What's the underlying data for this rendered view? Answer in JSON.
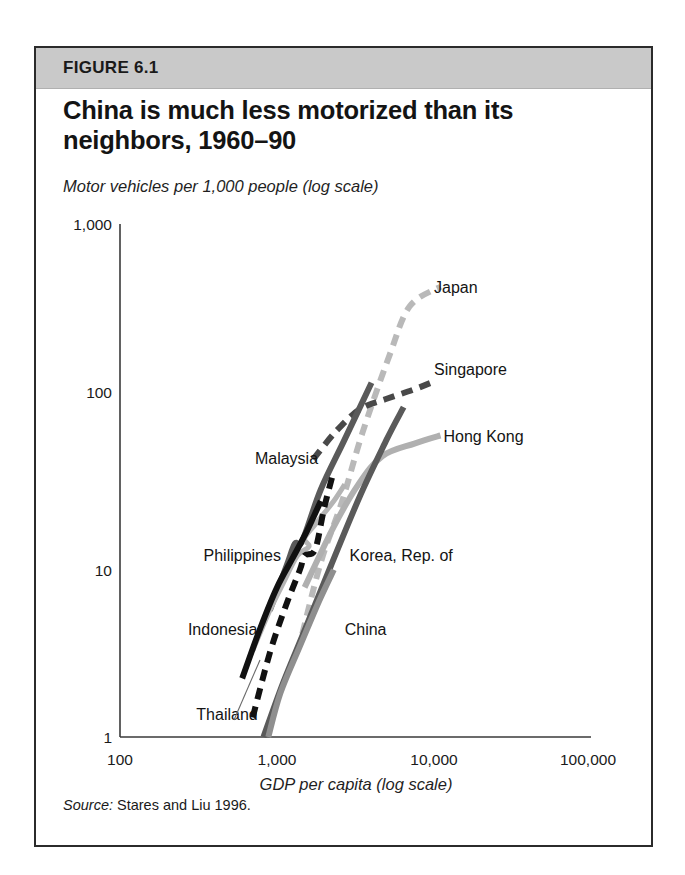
{
  "figure": {
    "number_label": "FIGURE 6.1",
    "title": "China is much less motorized than its neighbors, 1960–90",
    "source_prefix": "Source:",
    "source_text": " Stares and Liu 1996."
  },
  "chart_data": {
    "type": "line",
    "title": "China is much less motorized than its neighbors, 1960–90",
    "subtitle": "Motor vehicles per 1,000 people (log scale)",
    "xlabel": "GDP per capita (log scale)",
    "ylabel": "Motor vehicles per 1,000 people (log scale)",
    "xscale": "log",
    "yscale": "log",
    "xlim": [
      100,
      100000
    ],
    "ylim": [
      1,
      1000
    ],
    "xticks": [
      100,
      1000,
      10000,
      100000
    ],
    "xtick_labels": [
      "100",
      "1,000",
      "10,000",
      "100,000"
    ],
    "yticks": [
      1,
      10,
      100,
      1000
    ],
    "ytick_labels": [
      "1",
      "10",
      "100",
      "1,000"
    ],
    "grid": false,
    "legend": "inline-labels",
    "period": "1960–90",
    "series": [
      {
        "name": "Japan",
        "style": "dashed",
        "color": "#b9b9b9",
        "width": 6,
        "label_x": 10000,
        "label_y": 420,
        "points": [
          [
            1450,
            4.0
          ],
          [
            1900,
            10.5
          ],
          [
            2600,
            24.0
          ],
          [
            3500,
            60.0
          ],
          [
            5200,
            170.0
          ],
          [
            7000,
            330.0
          ],
          [
            11000,
            430.0
          ]
        ]
      },
      {
        "name": "Singapore",
        "style": "dashed",
        "color": "#494949",
        "width": 6,
        "label_x": 10000,
        "label_y": 140,
        "points": [
          [
            1700,
            42.0
          ],
          [
            2400,
            62.0
          ],
          [
            3400,
            83.0
          ],
          [
            5000,
            95.0
          ],
          [
            7500,
            108.0
          ],
          [
            10000,
            120.0
          ]
        ]
      },
      {
        "name": "Hong Kong",
        "style": "solid",
        "color": "#b0b0b0",
        "width": 6,
        "label_x": 11500,
        "label_y": 57,
        "points": [
          [
            1500,
            7.5
          ],
          [
            2300,
            17.0
          ],
          [
            3300,
            30.0
          ],
          [
            4700,
            44.0
          ],
          [
            7500,
            52.0
          ],
          [
            11000,
            58.0
          ]
        ]
      },
      {
        "name": "Malaysia",
        "style": "solid",
        "color": "#5a5a5a",
        "width": 6,
        "label_x": 1150,
        "label_y": 42,
        "points": [
          [
            900,
            5.5
          ],
          [
            1150,
            10.0
          ],
          [
            1300,
            13.5
          ],
          [
            1450,
            14.0
          ],
          [
            1900,
            28.0
          ],
          [
            2700,
            55.0
          ],
          [
            4000,
            118.0
          ]
        ]
      },
      {
        "name": "Philippines",
        "style": "solid",
        "color": "#b4b4b4",
        "width": 5,
        "label_x": 600,
        "label_y": 11.5,
        "points": [
          [
            700,
            3.2
          ],
          [
            900,
            5.5
          ],
          [
            1100,
            8.0
          ],
          [
            1350,
            11.5
          ],
          [
            1600,
            13.0
          ],
          [
            1500,
            14.5
          ],
          [
            1750,
            17.5
          ],
          [
            2300,
            24.0
          ],
          [
            2700,
            30.0
          ]
        ]
      },
      {
        "name": "Korea, Rep. of",
        "style": "solid",
        "color": "#5a5a5a",
        "width": 6,
        "label_x": 2900,
        "label_y": 11.5,
        "points": [
          [
            820,
            1.0
          ],
          [
            1100,
            2.1
          ],
          [
            1500,
            4.2
          ],
          [
            2200,
            10.0
          ],
          [
            3400,
            26.0
          ],
          [
            5000,
            55.0
          ],
          [
            6400,
            85.0
          ]
        ]
      },
      {
        "name": "China",
        "style": "solid",
        "color": "#8f8f8f",
        "width": 6,
        "label_x": 2700,
        "label_y": 4.2,
        "points": [
          [
            880,
            1.0
          ],
          [
            1050,
            1.8
          ],
          [
            1400,
            3.4
          ],
          [
            1850,
            6.2
          ],
          [
            2300,
            9.5
          ]
        ]
      },
      {
        "name": "Indonesia",
        "style": "solid",
        "color": "#111111",
        "width": 6,
        "label_x": 450,
        "label_y": 4.2,
        "points": [
          [
            600,
            2.2
          ],
          [
            780,
            4.3
          ],
          [
            1000,
            7.5
          ],
          [
            1250,
            11.0
          ],
          [
            1550,
            16.0
          ],
          [
            1900,
            24.0
          ]
        ]
      },
      {
        "name": "Thailand",
        "style": "dashed",
        "color": "#111111",
        "width": 6,
        "label_x": 480,
        "label_y": 1.35,
        "points": [
          [
            700,
            1.3
          ],
          [
            900,
            3.1
          ],
          [
            1150,
            6.0
          ],
          [
            1400,
            9.5
          ],
          [
            1500,
            11.5
          ],
          [
            1750,
            12.5
          ],
          [
            2000,
            22.0
          ],
          [
            2300,
            36.0
          ]
        ]
      }
    ]
  }
}
